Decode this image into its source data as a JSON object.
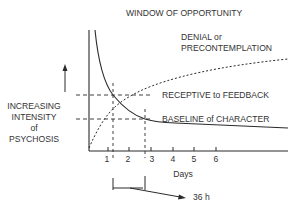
{
  "title": "WINDOW OF OPPORTUNITY",
  "y_axis": {
    "label_lines": [
      "INCREASING",
      "INTENSITY",
      "of",
      "PSYCHOSIS"
    ],
    "arrow": "up-arrow"
  },
  "x_axis": {
    "label": "Days",
    "ticks": [
      "1",
      "2",
      "3",
      "4",
      "5",
      "6"
    ]
  },
  "annotations": {
    "denial_line1": "DENIAL or",
    "denial_line2": "PRECONTEMPLATION",
    "receptive": "RECEPTIVE to FEEDBACK",
    "baseline": "BASELINE of CHARACTER",
    "window_duration": "36 h"
  },
  "curves": [
    {
      "name": "intensity-of-psychosis",
      "style": "solid",
      "description": "decays rapidly from high intensity, crossing RECEPTIVE level near day 1.3 and BASELINE near day 2.8, then levels off"
    },
    {
      "name": "denial-or-precontemplation",
      "style": "dotted",
      "description": "rises from near zero, crossing BASELINE near day 1 and RECEPTIVE near day 2.3, then approaches plateau"
    }
  ],
  "colors": {
    "line": "#2a2a2a",
    "text": "#333333",
    "background": "#ffffff"
  }
}
